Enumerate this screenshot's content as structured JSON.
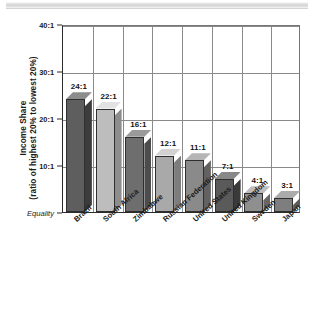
{
  "chart_data": {
    "type": "bar",
    "title": "",
    "subtitle": "",
    "xlabel": "",
    "ylabel": "Income Share (ratio of highest 20% to lowest 20%)",
    "ylabel_line1": "Income Share",
    "ylabel_line2": "(ratio of highest 20% to lowest 20%)",
    "categories": [
      "Brazil",
      "South Africa",
      "Zimbabwe",
      "Russian Federation",
      "United States",
      "United Kingdom",
      "Sweden",
      "Japan"
    ],
    "values": [
      24,
      22,
      16,
      12,
      11,
      7,
      4,
      3
    ],
    "value_labels": [
      "24:1",
      "22:1",
      "16:1",
      "12:1",
      "11:1",
      "7:1",
      "4:1",
      "3:1"
    ],
    "ylim": [
      0,
      40
    ],
    "yticks": [
      0,
      10,
      20,
      30,
      40
    ],
    "ytick_labels": [
      "Equality",
      "10:1",
      "20:1",
      "30:1",
      "40:1"
    ],
    "grid": true,
    "legend": "none",
    "bar_colors": [
      "#5e5e5e",
      "#bdbdbd",
      "#6e6e6e",
      "#a9a9a9",
      "#8a8a8a",
      "#5a5a5a",
      "#8f8f8f",
      "#7e7e7e"
    ],
    "bar_top_colors": [
      "#8c8c8c",
      "#e2e2e2",
      "#9a9a9a",
      "#d2d2d2",
      "#b5b5b5",
      "#888888",
      "#bcbcbc",
      "#ababab"
    ],
    "bar_side_colors": [
      "#3c3c3c",
      "#8d8d8d",
      "#4c4c4c",
      "#7c7c7c",
      "#626262",
      "#3a3a3a",
      "#666666",
      "#5a5a5a"
    ],
    "axis_color": "#2b2b2b",
    "grid_color": "#8a8a8a"
  }
}
